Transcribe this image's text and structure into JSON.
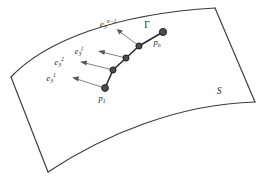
{
  "figure": {
    "surface": {
      "label": "S",
      "label_name": "surface-label",
      "edge_color": "#3a3a3a"
    },
    "curve": {
      "label": "Γ",
      "label_name": "curve-label",
      "color": "#2b2b2b"
    },
    "points": [
      {
        "id": "p1",
        "label_base": "p",
        "label_sub": "1",
        "x": 105,
        "y": 88
      },
      {
        "id": "p2",
        "label_base": "",
        "label_sub": "",
        "x": 113,
        "y": 70
      },
      {
        "id": "p3",
        "label_base": "",
        "label_sub": "",
        "x": 126,
        "y": 58
      },
      {
        "id": "p4",
        "label_base": "",
        "label_sub": "",
        "x": 139,
        "y": 46
      },
      {
        "id": "pn",
        "label_base": "p",
        "label_sub": "n",
        "x": 163,
        "y": 32
      }
    ],
    "vectors": [
      {
        "id": "e3-1",
        "base": "e",
        "sub": "3",
        "sup": "1",
        "tail_x": 105,
        "tail_y": 88,
        "head_x": 73,
        "head_y": 78,
        "label_x": 58,
        "label_y": 78
      },
      {
        "id": "e3-2",
        "base": "e",
        "sub": "3",
        "sup": "2",
        "tail_x": 113,
        "tail_y": 70,
        "head_x": 81,
        "head_y": 62,
        "label_x": 66,
        "label_y": 62
      },
      {
        "id": "e3-j",
        "base": "e",
        "sub": "3",
        "sup": "j",
        "tail_x": 126,
        "tail_y": 58,
        "head_x": 99,
        "head_y": 51,
        "label_x": 85,
        "label_y": 51
      },
      {
        "id": "e3-n-minus-1",
        "base": "e",
        "sub": "3",
        "sup": "n−1",
        "tail_x": 139,
        "tail_y": 46,
        "head_x": 117,
        "head_y": 29,
        "label_x": 104,
        "label_y": 26
      }
    ],
    "colors": {
      "background": "#ffffff",
      "ink": "#1f1f1f",
      "edge": "#3a3a3a",
      "node_fill": "#4d4d4d",
      "arrow": "#6a6a6a"
    }
  }
}
